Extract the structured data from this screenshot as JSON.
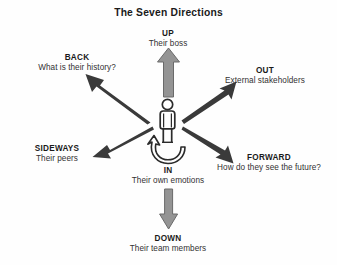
{
  "title": "The Seven Directions",
  "colors": {
    "background": "#fefefe",
    "text": "#231f20",
    "gray_arrow_fill": "#949494",
    "gray_arrow_stroke": "#6e6e6e",
    "dark_arrow": "#3a3a3a",
    "figure_stroke": "#2b2b2b",
    "figure_fill": "#ffffff"
  },
  "directions": [
    {
      "key": "up",
      "name": "UP",
      "description": "Their boss",
      "arrow_style": "gray-block",
      "arrow_direction": "up"
    },
    {
      "key": "back",
      "name": "BACK",
      "description": "What is their history?",
      "arrow_style": "dark-tapered",
      "arrow_direction": "up-left"
    },
    {
      "key": "out",
      "name": "OUT",
      "description": "External stakeholders",
      "arrow_style": "dark-tapered",
      "arrow_direction": "up-right"
    },
    {
      "key": "sideways",
      "name": "SIDEWAYS",
      "description": "Their peers",
      "arrow_style": "dark-tapered",
      "arrow_direction": "down-left"
    },
    {
      "key": "forward",
      "name": "FORWARD",
      "description": "How do they see the future?",
      "arrow_style": "dark-tapered",
      "arrow_direction": "down-right"
    },
    {
      "key": "in",
      "name": "IN",
      "description": "Their own emotions",
      "arrow_style": "curved-loop",
      "arrow_direction": "inward"
    },
    {
      "key": "down",
      "name": "DOWN",
      "description": "Their team members",
      "arrow_style": "gray-block",
      "arrow_direction": "down"
    }
  ],
  "center": {
    "icon": "person-figure",
    "label": ""
  }
}
